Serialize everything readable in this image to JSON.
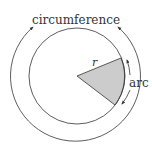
{
  "diagram": {
    "labels": {
      "circumference": "circumference",
      "radius": "r",
      "arc": "arc"
    },
    "colors": {
      "stroke": "#333333",
      "sector_fill": "#cccccc",
      "background": "#ffffff"
    }
  }
}
